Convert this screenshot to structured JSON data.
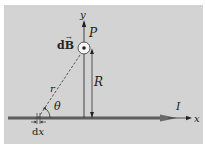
{
  "diagram": {
    "labels": {
      "y_axis": "y",
      "x_axis": "x",
      "point": "P",
      "field": "dB⃗",
      "field_text": "dB",
      "distance_R": "R",
      "distance_r": "r",
      "angle": "θ",
      "current": "I",
      "element": "dx"
    },
    "symbols": {
      "field_direction": "out-of-page-dot-icon"
    },
    "colors": {
      "background": "#d3d3d3",
      "wire": "#5a5a5a",
      "lines": "#333333",
      "dashed": "#444444"
    }
  }
}
